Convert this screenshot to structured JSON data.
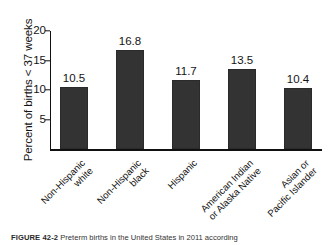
{
  "figure": {
    "caption_label": "FIGURE 42-2",
    "caption_text": "Preterm births in the United States in 2011 according"
  },
  "chart_data": {
    "type": "bar",
    "title": "",
    "xlabel": "",
    "ylabel": "Percent of births < 37 weeks",
    "ylim": [
      0,
      20
    ],
    "yticks": [
      "5",
      "10",
      "15",
      "20"
    ],
    "ytick_values": [
      5,
      10,
      15,
      20
    ],
    "grid": false,
    "legend": "none",
    "categories": [
      "Non-Hispanic white",
      "Non-Hispanic black",
      "Hispanic",
      "American Indian or Alaska Native",
      "Asian or Pacific Islander"
    ],
    "category_lines": [
      [
        "Non-Hispanic",
        "white"
      ],
      [
        "Non-Hispanic",
        "black"
      ],
      [
        "Hispanic"
      ],
      [
        "American Indian",
        "or Alaska Native"
      ],
      [
        "Asian or",
        "Pacific Islander"
      ]
    ],
    "values": [
      10.5,
      16.8,
      11.7,
      13.5,
      10.4
    ],
    "value_labels": [
      "10.5",
      "16.8",
      "11.7",
      "13.5",
      "10.4"
    ],
    "bar_color": "#333333"
  }
}
